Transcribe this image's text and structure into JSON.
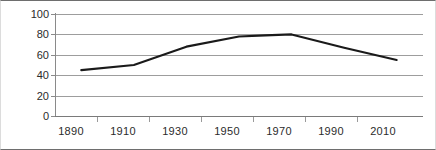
{
  "chart_data": {
    "type": "line",
    "title": "",
    "subtitle": "",
    "xlabel": "",
    "ylabel": "",
    "x": [
      1890,
      1910,
      1930,
      1950,
      1960,
      1970,
      1990,
      2010
    ],
    "values": [
      45,
      50,
      68,
      78,
      79,
      80,
      67,
      55
    ],
    "series": [
      {
        "name": "",
        "values": [
          45,
          50,
          68,
          78,
          79,
          80,
          67,
          55
        ]
      }
    ],
    "xlim": [
      1880,
      2020
    ],
    "ylim": [
      0,
      100
    ],
    "ytick_labels": [
      "100",
      "80",
      "60",
      "40",
      "20",
      "0"
    ],
    "ytick_values": [
      100,
      80,
      60,
      40,
      20,
      0
    ],
    "xtick_labels": [
      "1890",
      "1910",
      "1930",
      "1950",
      "1970",
      "1990",
      "2010"
    ],
    "xtick_values": [
      1890,
      1910,
      1930,
      1950,
      1970,
      1990,
      2010
    ],
    "grid": "horizontal",
    "legend": "none",
    "line_color": "#1a1a1a",
    "grid_color": "#9d9d9d",
    "axis_color": "#7a7a7a",
    "background_color": "#ffffff",
    "annotations": []
  },
  "accessibility": {
    "description": "Line chart of values by year from 1890 to 2010, rising from about 45 to a plateau of about 80 around 1950-1970, then declining to about 55."
  }
}
